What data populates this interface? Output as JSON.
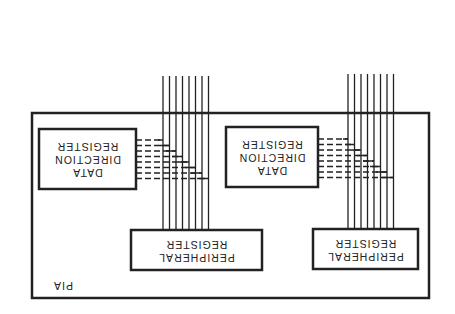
{
  "diagram": {
    "orientation": "rotated 180 degrees",
    "container": {
      "label": "PIA"
    },
    "units": [
      {
        "data_direction_register": {
          "line1": "DATA",
          "line2": "DIRECTION",
          "line3": "REGISTER"
        },
        "peripheral_register": {
          "line1": "PERIPHERAL",
          "line2": "REGISTER"
        },
        "bus_lines": 8
      },
      {
        "data_direction_register": {
          "line1": "DATA",
          "line2": "DIRECTION",
          "line3": "REGISTER"
        },
        "peripheral_register": {
          "line1": "PERIPHERAL",
          "line2": "REGISTER"
        },
        "bus_lines": 8
      }
    ],
    "colors": {
      "ink": "#222222",
      "background": "#ffffff"
    }
  }
}
